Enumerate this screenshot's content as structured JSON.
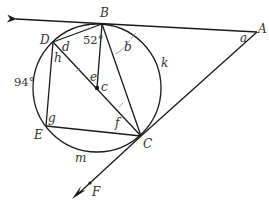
{
  "diagram": {
    "type": "circle-geometry",
    "points": {
      "A": {
        "label": "A",
        "x": 257,
        "y": 32
      },
      "B": {
        "label": "B",
        "x": 102,
        "y": 24
      },
      "C": {
        "label": "C",
        "x": 141,
        "y": 136
      },
      "D": {
        "label": "D",
        "x": 53,
        "y": 42
      },
      "E": {
        "label": "E",
        "x": 46,
        "y": 126
      },
      "F": {
        "label": "F",
        "x": 90,
        "y": 183
      },
      "center": {
        "label": "c",
        "x": 97,
        "y": 88
      }
    },
    "circle": {
      "cx": 97,
      "cy": 88,
      "r": 64
    },
    "angle_labels": {
      "a": "a",
      "b": "b",
      "d": "d",
      "e": "e",
      "f": "f",
      "g": "g",
      "h": "h"
    },
    "arc_labels": {
      "k": "k",
      "m": "m",
      "arc_DE": "94°"
    },
    "given_angle": "52°",
    "colors": {
      "line": "#1a1a1a",
      "text": "#333333",
      "background": "#ffffff"
    }
  }
}
